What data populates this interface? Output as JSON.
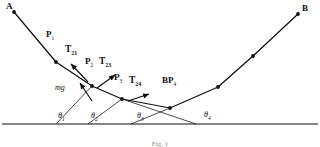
{
  "figure": {
    "caption": "Fig. 1",
    "background": "#ffffff",
    "stroke_color": "#111111",
    "points": [
      {
        "id": "A",
        "label": "A",
        "sub": "",
        "x": 14,
        "y": 12,
        "label_x": 8,
        "label_y": 3,
        "dot": true
      },
      {
        "id": "P1",
        "label": "P",
        "sub": "1",
        "x": 56,
        "y": 62,
        "label_x": 47,
        "label_y": 31,
        "dot": true
      },
      {
        "id": "P2",
        "label": "P",
        "sub": "2",
        "x": 92,
        "y": 86,
        "label_x": 86,
        "label_y": 58,
        "dot": true
      },
      {
        "id": "P3",
        "label": "P",
        "sub": "3",
        "x": 122,
        "y": 99,
        "label_x": 115,
        "label_y": 74,
        "dot": true
      },
      {
        "id": "P4",
        "label": "P",
        "sub": "4",
        "x": 170,
        "y": 108,
        "label_x": 163,
        "label_y": 77,
        "dot": true
      },
      {
        "id": "P5",
        "label": "",
        "sub": "",
        "x": 218,
        "y": 87,
        "label_x": 0,
        "label_y": 0,
        "dot": true
      },
      {
        "id": "P6",
        "label": "",
        "sub": "",
        "x": 253,
        "y": 56,
        "label_x": 0,
        "label_y": 0,
        "dot": true
      },
      {
        "id": "B",
        "label": "B",
        "sub": "",
        "x": 298,
        "y": 14,
        "label_x": 302,
        "label_y": 5,
        "dot": true
      }
    ],
    "vectors": [
      {
        "id": "T21",
        "label": "T",
        "sub": "21",
        "label_x": 66,
        "label_y": 47,
        "x1": 86,
        "y1": 80,
        "x2": 70,
        "y2": 63
      },
      {
        "id": "T23",
        "label": "T",
        "sub": "23",
        "label_x": 101,
        "label_y": 59,
        "x1": 100,
        "y1": 88,
        "x2": 116,
        "y2": 74
      },
      {
        "id": "T24",
        "label": "T",
        "sub": "24",
        "label_x": 131,
        "label_y": 78,
        "x1": 130,
        "y1": 101,
        "x2": 148,
        "y2": 93
      },
      {
        "id": "mg",
        "label": "mg",
        "sub": "",
        "label_x": 57,
        "label_y": 85,
        "x1": 92,
        "y1": 100,
        "x2": 80,
        "y2": 82
      }
    ],
    "angles": [
      {
        "id": "theta1",
        "label": "θ",
        "sub": "1",
        "label_x": 59,
        "label_y": 113
      },
      {
        "id": "theta2",
        "label": "θ",
        "sub": "2",
        "label_x": 92,
        "label_y": 113
      },
      {
        "id": "theta3",
        "label": "θ",
        "sub": "3",
        "label_x": 138,
        "label_y": 113
      },
      {
        "id": "theta4",
        "label": "θ",
        "sub": "4",
        "label_x": 205,
        "label_y": 112
      }
    ],
    "baseline": {
      "y": 124,
      "x1": 2,
      "x2": 318
    },
    "angle_rays": [
      {
        "from_x": 56,
        "from_y": 124,
        "to_x": 92,
        "to_y": 86
      },
      {
        "from_x": 88,
        "from_y": 124,
        "to_x": 122,
        "to_y": 99
      },
      {
        "from_x": 130,
        "from_y": 124,
        "to_x": 170,
        "to_y": 108
      },
      {
        "from_x": 196,
        "from_y": 124,
        "to_x": 122,
        "to_y": 99
      }
    ],
    "path_AB": "14,12 56,62 92,86 122,99 170,108 218,87 253,56 298,14"
  }
}
